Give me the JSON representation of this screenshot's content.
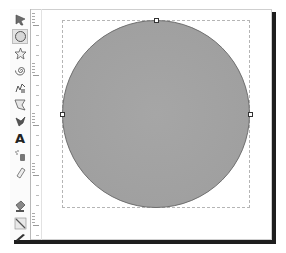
{
  "toolbox": {
    "tools": [
      {
        "name": "selector-tool",
        "icon": "pointer-icon",
        "active": false
      },
      {
        "name": "ellipse-tool",
        "icon": "circle-icon",
        "active": true
      },
      {
        "name": "star-tool",
        "icon": "star-icon",
        "active": false
      },
      {
        "name": "spiral-tool",
        "icon": "spiral-icon",
        "active": false
      },
      {
        "name": "pencil-tool",
        "icon": "pencil-icon",
        "active": false
      },
      {
        "name": "pen-tool",
        "icon": "pen-icon",
        "active": false
      },
      {
        "name": "calligraphy-tool",
        "icon": "calligraphy-icon",
        "active": false
      },
      {
        "name": "text-tool",
        "icon": "text-icon",
        "label": "A",
        "active": false
      },
      {
        "name": "spray-tool",
        "icon": "spray-icon",
        "active": false
      },
      {
        "name": "eraser-tool",
        "icon": "eraser-icon",
        "active": false
      },
      {
        "name": "paint-bucket-tool",
        "icon": "bucket-icon",
        "active": false
      },
      {
        "name": "gradient-tool",
        "icon": "gradient-icon",
        "active": false
      },
      {
        "name": "dropper-tool",
        "icon": "dropper-icon",
        "active": false
      }
    ]
  },
  "canvas": {
    "shape": "circle",
    "fill_color": "#a3a3a3",
    "stroke_color": "#6e6e6e",
    "selection_handles": [
      "top",
      "left",
      "right"
    ]
  },
  "colors": {
    "shadow": "#1e1e1e",
    "border": "#cfcfcf",
    "dashed_box": "#b5b5b5"
  }
}
